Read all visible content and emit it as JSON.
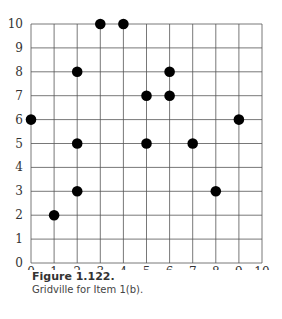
{
  "chart_data": {
    "type": "scatter",
    "title": "",
    "xlabel": "",
    "ylabel": "",
    "xlim": [
      0,
      10
    ],
    "ylim": [
      0,
      10
    ],
    "grid": true,
    "x_ticks": [
      "0",
      "1",
      "2",
      "3",
      "4",
      "5",
      "6",
      "7",
      "8",
      "9",
      "10"
    ],
    "y_ticks": [
      "0",
      "1",
      "2",
      "3",
      "4",
      "5",
      "6",
      "7",
      "8",
      "9",
      "10"
    ],
    "points": [
      {
        "x": 0,
        "y": 6
      },
      {
        "x": 1,
        "y": 2
      },
      {
        "x": 2,
        "y": 3
      },
      {
        "x": 2,
        "y": 5
      },
      {
        "x": 2,
        "y": 8
      },
      {
        "x": 3,
        "y": 10
      },
      {
        "x": 4,
        "y": 10
      },
      {
        "x": 5,
        "y": 5
      },
      {
        "x": 5,
        "y": 7
      },
      {
        "x": 6,
        "y": 7
      },
      {
        "x": 6,
        "y": 8
      },
      {
        "x": 7,
        "y": 5
      },
      {
        "x": 8,
        "y": 3
      },
      {
        "x": 9,
        "y": 6
      }
    ],
    "colors": {
      "point": "#000000",
      "grid": "#555555"
    }
  },
  "caption": {
    "title": "Figure 1.122.",
    "description": "Gridville for Item 1(b)."
  }
}
